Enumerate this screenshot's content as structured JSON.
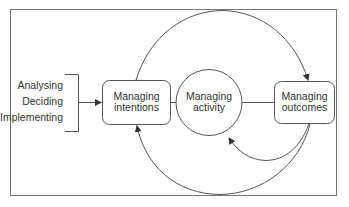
{
  "diagram": {
    "inputs": [
      "Analysing",
      "Deciding",
      "Implementing"
    ],
    "nodes": {
      "intentions": {
        "line1": "Managing",
        "line2": "intentions"
      },
      "activity": {
        "line1": "Managing",
        "line2": "activity"
      },
      "outcomes": {
        "line1": "Managing",
        "line2": "outcomes"
      }
    },
    "colors": {
      "stroke": "#555555",
      "frame": "#777777",
      "text": "#333333"
    }
  }
}
